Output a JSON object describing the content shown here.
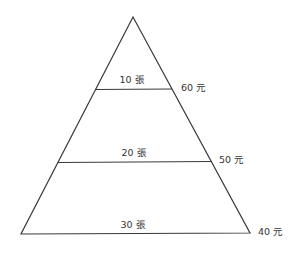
{
  "diagram": {
    "type": "pyramid",
    "stroke_color": "#3a3a3a",
    "text_color": "#333333",
    "tiers": [
      {
        "quantity_label": "10 張",
        "price_label": "60 元"
      },
      {
        "quantity_label": "20 張",
        "price_label": "50 元"
      },
      {
        "quantity_label": "30 張",
        "price_label": "40 元"
      }
    ]
  }
}
